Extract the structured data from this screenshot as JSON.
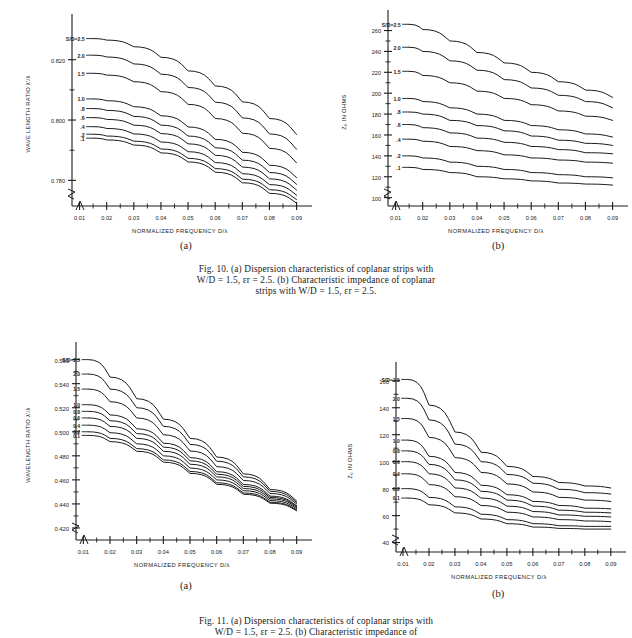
{
  "figures": [
    {
      "id": "fig10",
      "caption_line1": "Fig. 10.   (a) Dispersion characteristics of coplanar strips with",
      "caption_line2": "W/D = 1.5, εr = 2.5. (b) Characteristic impedance of coplanar",
      "caption_line3": "strips with W/D = 1.5, εr = 2.5.",
      "panel_a_letter": "(a)",
      "panel_b_letter": "(b)"
    },
    {
      "id": "fig11",
      "caption_line1": "Fig. 11.   (a) Dispersion characteristics of coplanar strips with",
      "caption_line2": "W/D = 1.5, εr = 2.5. (b) Characteristic impedance of",
      "panel_a_letter": "(a)",
      "panel_b_letter": "(b)"
    }
  ],
  "chart_data": [
    {
      "id": "fig10a",
      "type": "line",
      "title": "",
      "xlabel": "NORMALIZED FREQUENCY D/λ",
      "ylabel": "WAVE LENGTH RATIO λ'/λ",
      "xlim": [
        0.005,
        0.092
      ],
      "ylim": [
        0.7715,
        0.8325
      ],
      "xticks": [
        0.01,
        0.02,
        0.03,
        0.04,
        0.05,
        0.06,
        0.07,
        0.08,
        0.09
      ],
      "xticklabels": [
        "0.01",
        "0.02",
        "0.03",
        "0.04",
        "0.05",
        "0.06",
        "0.07",
        "0.08",
        "0.09"
      ],
      "yticks": [
        0.78,
        0.8,
        0.82
      ],
      "yticklabels": [
        "0.780",
        "0.800",
        "0.820"
      ],
      "yminorticks": [
        0.79,
        0.81,
        0.83
      ],
      "grid": false,
      "axis_break": true,
      "legend": "inline-curve-labels",
      "x": [
        0.015,
        0.02,
        0.03,
        0.04,
        0.05,
        0.06,
        0.07,
        0.08,
        0.09
      ],
      "series": [
        {
          "name": "S/D=2.5",
          "label": "S/D=2.5",
          "values": [
            0.827,
            0.8265,
            0.8243,
            0.8208,
            0.8163,
            0.8113,
            0.806,
            0.8005,
            0.7952
          ]
        },
        {
          "name": "2.0",
          "label": "2.0",
          "values": [
            0.8215,
            0.8209,
            0.8186,
            0.8152,
            0.8108,
            0.8059,
            0.8007,
            0.7954,
            0.7903
          ]
        },
        {
          "name": "1.5",
          "label": "1.5",
          "values": [
            0.8155,
            0.8149,
            0.8127,
            0.8094,
            0.8052,
            0.8005,
            0.7956,
            0.7906,
            0.7858
          ]
        },
        {
          "name": "1.0",
          "label": "1.0",
          "values": [
            0.807,
            0.8064,
            0.8044,
            0.8014,
            0.7977,
            0.7936,
            0.7893,
            0.785,
            0.7809
          ]
        },
        {
          "name": ".8",
          "label": ".8",
          "values": [
            0.8038,
            0.8032,
            0.8012,
            0.7983,
            0.7947,
            0.7908,
            0.7867,
            0.7826,
            0.7787
          ]
        },
        {
          "name": ".6",
          "label": ".6",
          "values": [
            0.8008,
            0.8002,
            0.7983,
            0.7955,
            0.7921,
            0.7883,
            0.7844,
            0.7805,
            0.7768
          ]
        },
        {
          "name": ".4",
          "label": ".4",
          "values": [
            0.7978,
            0.7972,
            0.7954,
            0.7927,
            0.7895,
            0.7859,
            0.7822,
            0.7786,
            0.7751
          ]
        },
        {
          "name": ".2",
          "label": ".2",
          "values": [
            0.7953,
            0.7947,
            0.793,
            0.7904,
            0.7873,
            0.7839,
            0.7804,
            0.7769,
            0.7736
          ]
        },
        {
          "name": ".1",
          "label": ".1",
          "values": [
            0.794,
            0.7934,
            0.7917,
            0.7891,
            0.7861,
            0.7827,
            0.7792,
            0.7757,
            0.7724
          ]
        }
      ]
    },
    {
      "id": "fig10b",
      "type": "line",
      "title": "",
      "xlabel": "NORMALIZED FREQUENCY D/λ",
      "ylabel": "Z₀ IN OHMS",
      "xlim": [
        0.005,
        0.092
      ],
      "ylim": [
        92,
        272
      ],
      "xticks": [
        0.01,
        0.02,
        0.03,
        0.04,
        0.05,
        0.06,
        0.07,
        0.08,
        0.09
      ],
      "xticklabels": [
        "0.01",
        "0.02",
        "0.03",
        "0.04",
        "0.05",
        "0.06",
        "0.07",
        "0.08",
        "0.09"
      ],
      "yticks": [
        100,
        120,
        140,
        160,
        180,
        200,
        220,
        240,
        260
      ],
      "yticklabels": [
        "100",
        "120",
        "140",
        "160",
        "180",
        "200",
        "220",
        "240",
        "260"
      ],
      "grid": false,
      "axis_break": true,
      "legend": "inline-curve-labels",
      "x": [
        0.015,
        0.02,
        0.03,
        0.04,
        0.05,
        0.06,
        0.07,
        0.08,
        0.09
      ],
      "series": [
        {
          "name": "S/D=2.5",
          "label": "S/D=2.5",
          "values": [
            266,
            261,
            250,
            239,
            229,
            220,
            211,
            203,
            196
          ]
        },
        {
          "name": "2.0",
          "label": "2.0",
          "values": [
            244,
            240,
            231,
            222,
            213,
            205,
            198,
            192,
            186
          ]
        },
        {
          "name": "1.5",
          "label": "1.5",
          "values": [
            221,
            217,
            210,
            202,
            195,
            189,
            183,
            178,
            174
          ]
        },
        {
          "name": "1.0",
          "label": "1.0",
          "values": [
            195,
            192,
            186,
            180,
            174,
            169,
            165,
            161,
            158
          ]
        },
        {
          "name": ".8",
          "label": ".8",
          "values": [
            182,
            180,
            174,
            169,
            164,
            159,
            155,
            152,
            150
          ]
        },
        {
          "name": ".6",
          "label": ".6",
          "values": [
            170,
            167,
            162,
            157,
            153,
            149,
            146,
            143,
            142
          ]
        },
        {
          "name": ".4",
          "label": ".4",
          "values": [
            156,
            154,
            149,
            145,
            141,
            138,
            136,
            134,
            133
          ]
        },
        {
          "name": ".2",
          "label": ".2",
          "values": [
            140,
            138,
            134,
            130,
            127,
            124,
            122,
            120,
            119
          ]
        },
        {
          "name": ".1",
          "label": ".1",
          "values": [
            129,
            127,
            124,
            120,
            118,
            116,
            114,
            113,
            112
          ]
        }
      ]
    },
    {
      "id": "fig11a",
      "type": "line",
      "title": "",
      "xlabel": "NORMALIZED FREQUENCY D/λ",
      "ylabel": "WAVELENGTH RATIO λ'/λ",
      "xlim": [
        0.005,
        0.092
      ],
      "ylim": [
        0.41,
        0.568
      ],
      "xticks": [
        0.01,
        0.02,
        0.03,
        0.04,
        0.05,
        0.06,
        0.07,
        0.08,
        0.09
      ],
      "xticklabels": [
        "0.01",
        "0.02",
        "0.03",
        "0.04",
        "0.05",
        "0.06",
        "0.07",
        "0.08",
        "0.09"
      ],
      "yticks": [
        0.42,
        0.44,
        0.46,
        0.48,
        0.5,
        0.52,
        0.54,
        0.56
      ],
      "yticklabels": [
        "0.420",
        "0.440",
        "0.460",
        "0.480",
        "0.500",
        "0.520",
        "0.540",
        "0.560"
      ],
      "grid": false,
      "axis_break": true,
      "legend": "inline-curve-labels",
      "x": [
        0.012,
        0.02,
        0.03,
        0.04,
        0.05,
        0.06,
        0.07,
        0.08,
        0.09
      ],
      "series": [
        {
          "name": "S/D=2.5",
          "label": "S/D=2.5",
          "values": [
            0.56,
            0.5455,
            0.5275,
            0.5105,
            0.4945,
            0.479,
            0.465,
            0.452,
            0.4425
          ]
        },
        {
          "name": "2.0",
          "label": "2.0",
          "values": [
            0.548,
            0.5355,
            0.52,
            0.5045,
            0.4895,
            0.4755,
            0.4625,
            0.4505,
            0.4412
          ]
        },
        {
          "name": "1.5",
          "label": "1.5",
          "values": [
            0.5355,
            0.525,
            0.5115,
            0.4975,
            0.484,
            0.471,
            0.4595,
            0.4487,
            0.44
          ]
        },
        {
          "name": "1.0",
          "label": "1.0",
          "values": [
            0.5225,
            0.514,
            0.5025,
            0.4905,
            0.4785,
            0.4668,
            0.4562,
            0.4465,
            0.4385
          ]
        },
        {
          "name": "0.8",
          "label": "0.8",
          "values": [
            0.517,
            0.5092,
            0.4985,
            0.4872,
            0.4758,
            0.4647,
            0.4546,
            0.4454,
            0.4378
          ]
        },
        {
          "name": "0.6",
          "label": "0.6",
          "values": [
            0.5115,
            0.5045,
            0.4945,
            0.4838,
            0.473,
            0.4625,
            0.4528,
            0.4442,
            0.437
          ]
        },
        {
          "name": "0.4",
          "label": "0.4",
          "values": [
            0.5055,
            0.4992,
            0.49,
            0.48,
            0.4698,
            0.46,
            0.451,
            0.4428,
            0.436
          ]
        },
        {
          "name": "0.2",
          "label": "0.2",
          "values": [
            0.5,
            0.4945,
            0.486,
            0.4766,
            0.467,
            0.4576,
            0.4491,
            0.4414,
            0.435
          ]
        },
        {
          "name": "0.1",
          "label": "0.1",
          "values": [
            0.497,
            0.4918,
            0.4838,
            0.4747,
            0.4654,
            0.4563,
            0.448,
            0.4406,
            0.4343
          ]
        }
      ]
    },
    {
      "id": "fig11b",
      "type": "line",
      "title": "",
      "xlabel": "NORMALIZED FREQUENCY D/λ",
      "ylabel": "Z₀ IN OHMS",
      "xlim": [
        0.005,
        0.092
      ],
      "ylim": [
        33,
        168
      ],
      "xticks": [
        0.01,
        0.02,
        0.03,
        0.04,
        0.05,
        0.06,
        0.07,
        0.08,
        0.09
      ],
      "xticklabels": [
        "0.01",
        "0.02",
        "0.03",
        "0.04",
        "0.05",
        "0.06",
        "0.07",
        "0.08",
        "0.09"
      ],
      "yticks": [
        40,
        60,
        80,
        100,
        120,
        140,
        160
      ],
      "yticklabels": [
        "40",
        "60",
        "80",
        "100",
        "120",
        "140",
        "160"
      ],
      "grid": false,
      "axis_break": true,
      "legend": "inline-curve-labels",
      "x": [
        0.012,
        0.02,
        0.03,
        0.04,
        0.05,
        0.06,
        0.07,
        0.08,
        0.09
      ],
      "series": [
        {
          "name": "S/D=2.5",
          "label": "S/D=2.5",
          "values": [
            161,
            142,
            122,
            107,
            96.5,
            89,
            84.5,
            82,
            80.5
          ]
        },
        {
          "name": "2.0",
          "label": "2.0",
          "values": [
            147,
            131,
            113,
            100,
            90.5,
            84,
            79.5,
            77,
            76
          ]
        },
        {
          "name": "1.5",
          "label": "1.5",
          "values": [
            132,
            118,
            103,
            92,
            83.5,
            77.5,
            73.5,
            71.5,
            70.5
          ]
        },
        {
          "name": "1.0",
          "label": "1.0",
          "values": [
            116,
            104,
            92,
            82.5,
            75.5,
            70.5,
            67.5,
            65.5,
            65
          ]
        },
        {
          "name": "0.8",
          "label": "0.8",
          "values": [
            108,
            98,
            86.5,
            78,
            71.5,
            67,
            64,
            62.5,
            62
          ]
        },
        {
          "name": "0.6",
          "label": "0.6",
          "values": [
            100,
            91,
            80.5,
            73,
            67,
            63,
            60.5,
            59.5,
            59
          ]
        },
        {
          "name": "0.4",
          "label": "0.4",
          "values": [
            91,
            83,
            74,
            67.5,
            62.5,
            59,
            57,
            56,
            55.5
          ]
        },
        {
          "name": "0.2",
          "label": "0.2",
          "values": [
            80,
            73.5,
            66.5,
            61,
            57,
            54,
            52.5,
            52,
            52
          ]
        },
        {
          "name": "0.1",
          "label": "0.1",
          "values": [
            73,
            68,
            62,
            57.5,
            54,
            51.5,
            50.5,
            50,
            50
          ]
        }
      ]
    }
  ]
}
